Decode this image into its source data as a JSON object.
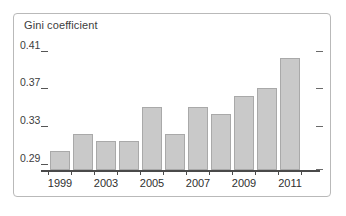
{
  "chart_data": {
    "type": "bar",
    "title": "Gini coefficient",
    "xlabel": "",
    "ylabel": "",
    "ylim": [
      0.29,
      0.42
    ],
    "grid": false,
    "legend": null,
    "categories": [
      "2001",
      "2002",
      "2003",
      "2004",
      "2005",
      "2006",
      "2007",
      "2008",
      "2009",
      "2010",
      "2011"
    ],
    "values": [
      0.31,
      0.329,
      0.321,
      0.321,
      0.358,
      0.329,
      0.358,
      0.35,
      0.369,
      0.378,
      0.41
    ],
    "y_tick_labels": [
      "0.41",
      "0.37",
      "0.33",
      "0.29"
    ],
    "y_tick_values": [
      0.41,
      0.37,
      0.33,
      0.29
    ],
    "x_tick_labels": [
      "1999",
      "2003",
      "2005",
      "2007",
      "2009",
      "2011"
    ],
    "x_tick_values": [
      "1999",
      "2003",
      "2005",
      "2007",
      "2009",
      "2011"
    ],
    "bar_color": "#c9c9c9",
    "bar_border_color": "#a9a9a9",
    "axis_color": "#4a4a4a",
    "text_color": "#2f2f2f",
    "frame_color": "#b9b9b9"
  }
}
